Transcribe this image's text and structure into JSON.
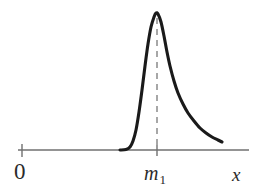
{
  "figure": {
    "title": "",
    "background_color": "#ffffff",
    "width": 259,
    "height": 194
  },
  "labels": {
    "origin": "0",
    "mode_base": "m",
    "mode_subscript": "1",
    "mode_full": "m1",
    "xaxis": "x"
  },
  "colors": {
    "curve": "#1a1a1a",
    "axis": "#707070",
    "dashed_line": "#8a8a8a",
    "tick": "#707070",
    "text": "#2b2b2b"
  },
  "chart_data": {
    "type": "line",
    "title": "",
    "xlabel": "x",
    "ylabel": "",
    "grid": false,
    "legend": null,
    "axis": {
      "x_axis_y_px": 150,
      "x_axis_start_px": 18,
      "x_axis_end_px": 249,
      "origin_tick_px": 22,
      "mode_tick_px": 157
    },
    "annotations": [
      {
        "name": "origin-tick",
        "label": "0",
        "x_px": 22,
        "type": "tick"
      },
      {
        "name": "mode-tick",
        "label": "m1",
        "x_px": 157,
        "type": "tick"
      },
      {
        "name": "mode-dashed-line",
        "label": "m1",
        "x_px": 157,
        "y_top_px": 18,
        "y_bottom_px": 150,
        "type": "vertical-dashed-line",
        "dash_pattern": "6,5"
      }
    ],
    "series": [
      {
        "name": "skewed-density-curve",
        "description": "right-skewed unimodal probability density curve with mode at m1",
        "points_px": [
          [
            120,
            150
          ],
          [
            126,
            149.5
          ],
          [
            130,
            147
          ],
          [
            133,
            141
          ],
          [
            136,
            130
          ],
          [
            139,
            112
          ],
          [
            142,
            90
          ],
          [
            145,
            66
          ],
          [
            148,
            44
          ],
          [
            151,
            27
          ],
          [
            154,
            17
          ],
          [
            156,
            13
          ],
          [
            158,
            14
          ],
          [
            161,
            22
          ],
          [
            164,
            36
          ],
          [
            167,
            52
          ],
          [
            170,
            66
          ],
          [
            174,
            81
          ],
          [
            178,
            93
          ],
          [
            183,
            104
          ],
          [
            188,
            113
          ],
          [
            194,
            121
          ],
          [
            200,
            128
          ],
          [
            206,
            133
          ],
          [
            212,
            137
          ],
          [
            218,
            140
          ],
          [
            222,
            142
          ]
        ],
        "peak_px": [
          156,
          13
        ],
        "peak_x_label": "m1"
      }
    ]
  }
}
